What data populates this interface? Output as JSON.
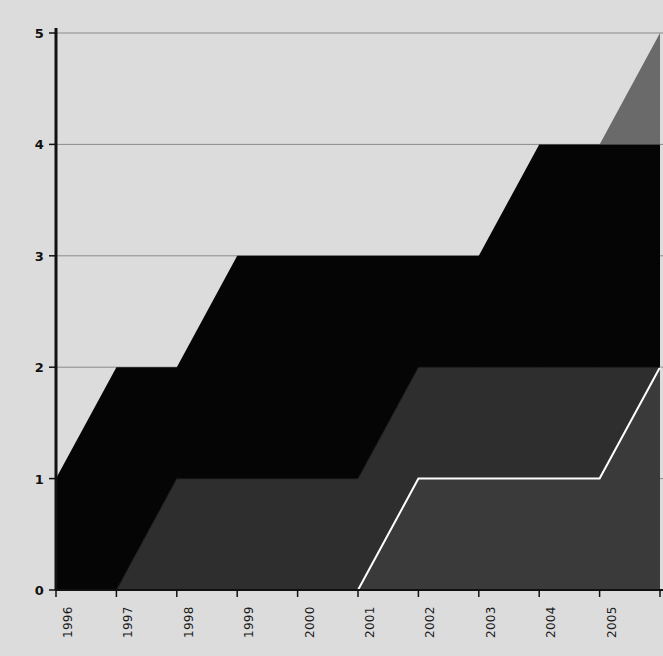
{
  "chart_data": {
    "type": "area",
    "stacked": true,
    "title": "",
    "xlabel": "",
    "ylabel": "",
    "categories": [
      "1996",
      "1997",
      "1998",
      "1999",
      "2000",
      "2001",
      "2002",
      "2003",
      "2004",
      "2005",
      "2006"
    ],
    "x": [
      1996,
      1997,
      1998,
      1999,
      2000,
      2001,
      2002,
      2003,
      2004,
      2005,
      2006
    ],
    "xlim": [
      1996,
      2006
    ],
    "ylim": [
      0,
      5
    ],
    "ytick_labels": [
      "0",
      "1",
      "2",
      "3",
      "4",
      "5"
    ],
    "ytick_values": [
      0,
      1,
      2,
      3,
      4,
      5
    ],
    "grid": true,
    "grid_axis": "y",
    "legend": "none",
    "background_color": "#dcdcdc",
    "axis_color": "#111111",
    "grid_color": "#8a8a8a",
    "series": [
      {
        "name": "series-1",
        "color": "#3a3a3a",
        "edge_color": "#ffffff",
        "edge_width": 2,
        "values": [
          0,
          0,
          0,
          0,
          0,
          0,
          1,
          1,
          1,
          1,
          2
        ],
        "cumulative": [
          0,
          0,
          0,
          0,
          0,
          0,
          1,
          1,
          1,
          1,
          2
        ]
      },
      {
        "name": "series-2",
        "color": "#2e2e2e",
        "edge_color": "#111111",
        "edge_width": 1,
        "values": [
          0,
          0,
          1,
          1,
          1,
          1,
          1,
          1,
          1,
          1,
          0
        ],
        "cumulative": [
          0,
          0,
          1,
          1,
          1,
          1,
          2,
          2,
          2,
          2,
          2
        ]
      },
      {
        "name": "series-3",
        "color": "#050505",
        "edge_color": "#050505",
        "edge_width": 1,
        "values": [
          1,
          2,
          1,
          2,
          2,
          2,
          1,
          1,
          2,
          2,
          2
        ],
        "cumulative": [
          1,
          2,
          2,
          3,
          3,
          3,
          3,
          3,
          4,
          4,
          4
        ]
      },
      {
        "name": "series-4",
        "color": "#6a6a6a",
        "edge_color": "#6a6a6a",
        "edge_width": 1,
        "values": [
          0,
          0,
          0,
          0,
          0,
          0,
          0,
          0,
          0,
          0,
          1
        ],
        "cumulative": [
          1,
          2,
          2,
          3,
          3,
          3,
          3,
          3,
          4,
          4,
          5
        ]
      }
    ]
  },
  "axes": {
    "y_ticks": [
      {
        "label": "5",
        "value": 5
      },
      {
        "label": "4",
        "value": 4
      },
      {
        "label": "3",
        "value": 3
      },
      {
        "label": "2",
        "value": 2
      },
      {
        "label": "1",
        "value": 1
      },
      {
        "label": "0",
        "value": 0
      }
    ],
    "x_ticks": [
      {
        "label": "1996",
        "value": 1996
      },
      {
        "label": "1997",
        "value": 1997
      },
      {
        "label": "1998",
        "value": 1998
      },
      {
        "label": "1999",
        "value": 1999
      },
      {
        "label": "2000",
        "value": 2000
      },
      {
        "label": "2001",
        "value": 2001
      },
      {
        "label": "2002",
        "value": 2002
      },
      {
        "label": "2003",
        "value": 2003
      },
      {
        "label": "2004",
        "value": 2004
      },
      {
        "label": "2005",
        "value": 2005
      },
      {
        "label": "2006",
        "value": 2006
      }
    ]
  }
}
